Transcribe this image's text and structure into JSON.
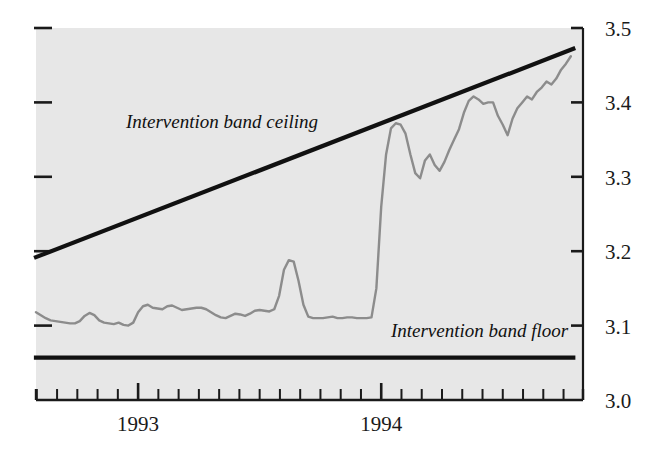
{
  "chart_data": {
    "type": "line",
    "title": "",
    "subtitle": "",
    "xlabel": "",
    "ylabel": "",
    "grid": false,
    "legend_position": "inline-annotations",
    "xlim": [
      1992.58,
      1994.83
    ],
    "ylim": [
      3.0,
      3.5
    ],
    "y_ticks": [
      3.0,
      3.1,
      3.2,
      3.3,
      3.4,
      3.5
    ],
    "y_tick_labels": [
      "3.0",
      "3.1",
      "3.2",
      "3.3",
      "3.4",
      "3.5"
    ],
    "y_axis_side": "right",
    "x_tick_labels": [
      "1993",
      "1994"
    ],
    "x_tick_values": [
      1993.0,
      1994.0
    ],
    "x_minor_ticks_per_year": 12,
    "annotations": [
      {
        "text": "Intervention band ceiling",
        "x": 1992.95,
        "y": 3.365
      },
      {
        "text": "Intervention band floor",
        "x": 1994.04,
        "y": 3.085
      }
    ],
    "series": [
      {
        "name": "Intervention band ceiling",
        "style": "solid-thick-black",
        "color": "#111111",
        "x": [
          1992.58,
          1994.79
        ],
        "values": [
          3.192,
          3.472
        ]
      },
      {
        "name": "Intervention band floor",
        "style": "solid-thick-black",
        "color": "#111111",
        "x": [
          1992.58,
          1994.79
        ],
        "values": [
          3.057,
          3.057
        ]
      },
      {
        "name": "Exchange rate",
        "style": "solid-thin-gray",
        "color": "#8c8c8c",
        "x": [
          1992.58,
          1992.6,
          1992.62,
          1992.64,
          1992.66,
          1992.68,
          1992.7,
          1992.72,
          1992.74,
          1992.76,
          1992.78,
          1992.8,
          1992.82,
          1992.84,
          1992.86,
          1992.88,
          1992.9,
          1992.92,
          1992.94,
          1992.96,
          1992.98,
          1993.0,
          1993.02,
          1993.04,
          1993.06,
          1993.08,
          1993.1,
          1993.12,
          1993.14,
          1993.16,
          1993.18,
          1993.2,
          1993.22,
          1993.24,
          1993.26,
          1993.28,
          1993.3,
          1993.32,
          1993.34,
          1993.36,
          1993.38,
          1993.4,
          1993.42,
          1993.44,
          1993.46,
          1993.48,
          1993.5,
          1993.52,
          1993.54,
          1993.56,
          1993.58,
          1993.6,
          1993.62,
          1993.64,
          1993.66,
          1993.68,
          1993.7,
          1993.72,
          1993.74,
          1993.76,
          1993.78,
          1993.8,
          1993.82,
          1993.84,
          1993.86,
          1993.88,
          1993.9,
          1993.92,
          1993.94,
          1993.96,
          1993.98,
          1994.0,
          1994.02,
          1994.04,
          1994.06,
          1994.08,
          1994.1,
          1994.12,
          1994.14,
          1994.16,
          1994.18,
          1994.2,
          1994.22,
          1994.24,
          1994.26,
          1994.28,
          1994.3,
          1994.32,
          1994.34,
          1994.36,
          1994.38,
          1994.4,
          1994.42,
          1994.44,
          1994.46,
          1994.48,
          1994.5,
          1994.52,
          1994.54,
          1994.56,
          1994.58,
          1994.6,
          1994.62,
          1994.64,
          1994.66,
          1994.68,
          1994.7,
          1994.72,
          1994.74,
          1994.76,
          1994.78
        ],
        "values": [
          3.118,
          3.114,
          3.11,
          3.107,
          3.106,
          3.105,
          3.104,
          3.103,
          3.103,
          3.106,
          3.113,
          3.117,
          3.114,
          3.107,
          3.104,
          3.103,
          3.102,
          3.104,
          3.101,
          3.1,
          3.104,
          3.118,
          3.126,
          3.128,
          3.124,
          3.123,
          3.122,
          3.126,
          3.127,
          3.124,
          3.121,
          3.122,
          3.123,
          3.124,
          3.124,
          3.122,
          3.118,
          3.114,
          3.111,
          3.11,
          3.113,
          3.116,
          3.115,
          3.113,
          3.116,
          3.12,
          3.121,
          3.12,
          3.119,
          3.122,
          3.14,
          3.175,
          3.188,
          3.186,
          3.16,
          3.128,
          3.112,
          3.11,
          3.11,
          3.11,
          3.111,
          3.112,
          3.11,
          3.11,
          3.111,
          3.111,
          3.11,
          3.11,
          3.11,
          3.111,
          3.15,
          3.26,
          3.33,
          3.365,
          3.372,
          3.37,
          3.358,
          3.33,
          3.305,
          3.298,
          3.322,
          3.33,
          3.316,
          3.308,
          3.32,
          3.336,
          3.35,
          3.364,
          3.386,
          3.402,
          3.408,
          3.404,
          3.398,
          3.4,
          3.4,
          3.382,
          3.37,
          3.356,
          3.378,
          3.392,
          3.4,
          3.408,
          3.404,
          3.414,
          3.42,
          3.428,
          3.424,
          3.432,
          3.444,
          3.452,
          3.462
        ]
      }
    ]
  },
  "axis": {
    "right_tick_labels": [
      "3.5",
      "3.4",
      "3.3",
      "3.2",
      "3.1",
      "3.0"
    ],
    "bottom_tick_labels": [
      "1993",
      "1994"
    ]
  },
  "annotations": {
    "ceiling_label": "Intervention band ceiling",
    "floor_label": "Intervention band floor"
  },
  "colors": {
    "plot_background": "#e7e7e7",
    "band_line": "#111111",
    "series_line": "#8c8c8c",
    "axis": "#1a1a1a",
    "text": "#1a1a1a"
  }
}
